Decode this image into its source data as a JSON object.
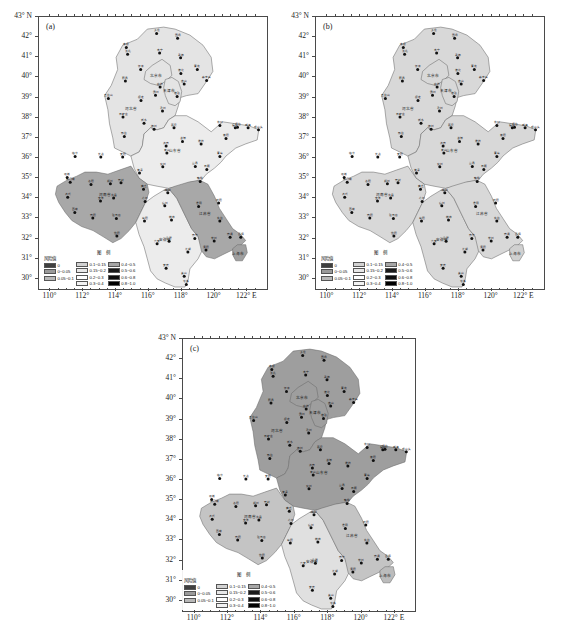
{
  "figure": {
    "type": "multi-panel-choropleth-map",
    "panel_count": 3
  },
  "panels": [
    {
      "id": "a",
      "label": "(a)"
    },
    {
      "id": "b",
      "label": "(b)"
    },
    {
      "id": "c",
      "label": "(c)"
    }
  ],
  "axes": {
    "ylabel_suffix": "N",
    "xlabel_suffix": "E",
    "yticks": [
      "43",
      "42",
      "41",
      "40",
      "39",
      "38",
      "37",
      "36",
      "35",
      "34",
      "33",
      "32",
      "31",
      "30"
    ],
    "ytick_values": [
      43,
      42,
      41,
      40,
      39,
      38,
      37,
      36,
      35,
      34,
      33,
      32,
      31,
      30
    ],
    "xticks": [
      "110",
      "112",
      "114",
      "116",
      "118",
      "120",
      "122"
    ],
    "xtick_values": [
      110,
      112,
      114,
      116,
      118,
      120,
      122
    ],
    "ylim": [
      29.5,
      43
    ],
    "xlim": [
      109.3,
      123.2
    ],
    "first_ytick_label": "43° N",
    "last_xtick_label": "122° E",
    "degree_symbol": "°"
  },
  "legend": {
    "title": "图 例",
    "risk_header": "风险值",
    "columns": [
      {
        "entries": [
          {
            "label": "0",
            "color": "#3f3f3f"
          },
          {
            "label": "0~0.05",
            "color": "#9a9a9a"
          },
          {
            "label": "0.05~0.1",
            "color": "#b8b8b8"
          }
        ]
      },
      {
        "entries": [
          {
            "label": "0.1~0.15",
            "color": "#d2d2d2"
          },
          {
            "label": "0.15~0.2",
            "color": "#e8e8e8"
          },
          {
            "label": "0.2~0.3",
            "color": "#ffffff"
          },
          {
            "label": "0.3~0.4",
            "color": "#f2f2f2"
          }
        ]
      },
      {
        "entries": [
          {
            "label": "0.4~0.5",
            "color": "#a6a6a6"
          },
          {
            "label": "0.5~0.6",
            "color": "#1a1a1a"
          },
          {
            "label": "0.6~0.8",
            "color": "#0d0d0d"
          },
          {
            "label": "0.8~1.0",
            "color": "#000000"
          }
        ]
      }
    ]
  },
  "chart_data": {
    "type": "heatmap",
    "title": "",
    "xlabel": "Longitude (°E)",
    "ylabel": "Latitude (°N)",
    "xlim": [
      109.3,
      123.2
    ],
    "ylim": [
      29.5,
      43
    ],
    "grid": false,
    "legend_position": "inside-bottom-left",
    "categories": [
      "河北省",
      "北京市",
      "天津市",
      "山东省",
      "河南省",
      "安徽省",
      "江苏省",
      "上海市"
    ],
    "series": [
      {
        "name": "(a)",
        "values": [
          0.17,
          0.17,
          0.17,
          0.25,
          0.45,
          0.25,
          0.45,
          0.45
        ]
      },
      {
        "name": "(b)",
        "values": [
          0.13,
          0.13,
          0.13,
          0.13,
          0.13,
          0.13,
          0.13,
          0.13
        ]
      },
      {
        "name": "(c)",
        "values": [
          0.45,
          0.45,
          0.45,
          0.45,
          0.25,
          0.17,
          0.25,
          0.25
        ]
      }
    ]
  },
  "regions": [
    {
      "name": "北京市",
      "lon": 116.4,
      "lat": 40.0
    },
    {
      "name": "天津市",
      "lon": 117.2,
      "lat": 39.3
    },
    {
      "name": "河北省",
      "lon": 114.9,
      "lat": 38.4
    },
    {
      "name": "山东省",
      "lon": 117.6,
      "lat": 36.3
    },
    {
      "name": "河南省",
      "lon": 113.3,
      "lat": 34.1
    },
    {
      "name": "安徽省",
      "lon": 117.0,
      "lat": 31.9
    },
    {
      "name": "江苏省",
      "lon": 119.4,
      "lat": 33.2
    },
    {
      "name": "上海市",
      "lon": 121.4,
      "lat": 31.2
    }
  ],
  "stations": [
    {
      "name": "围场",
      "lon": 117.75,
      "lat": 41.95
    },
    {
      "name": "多伦",
      "lon": 116.47,
      "lat": 42.18
    },
    {
      "name": "张北",
      "lon": 114.7,
      "lat": 41.15
    },
    {
      "name": "康保",
      "lon": 114.62,
      "lat": 41.48
    },
    {
      "name": "丰宁",
      "lon": 116.65,
      "lat": 41.22
    },
    {
      "name": "承德",
      "lon": 117.93,
      "lat": 40.98
    },
    {
      "name": "青龙",
      "lon": 118.95,
      "lat": 40.4
    },
    {
      "name": "怀来",
      "lon": 115.5,
      "lat": 40.4
    },
    {
      "name": "蔚县",
      "lon": 114.57,
      "lat": 39.83
    },
    {
      "name": "遵化",
      "lon": 117.95,
      "lat": 40.2
    },
    {
      "name": "秦皇岛",
      "lon": 119.52,
      "lat": 39.85
    },
    {
      "name": "唐山",
      "lon": 118.15,
      "lat": 39.67
    },
    {
      "name": "廊坊",
      "lon": 116.68,
      "lat": 39.52
    },
    {
      "name": "塘沽",
      "lon": 117.72,
      "lat": 39.05
    },
    {
      "name": "霸州",
      "lon": 116.4,
      "lat": 39.12
    },
    {
      "name": "保定",
      "lon": 115.52,
      "lat": 38.85
    },
    {
      "name": "沧州",
      "lon": 116.83,
      "lat": 38.33
    },
    {
      "name": "五台山",
      "lon": 113.53,
      "lat": 38.95
    },
    {
      "name": "石家庄",
      "lon": 114.42,
      "lat": 38.03
    },
    {
      "name": "衡水",
      "lon": 115.7,
      "lat": 37.73
    },
    {
      "name": "邢台",
      "lon": 114.5,
      "lat": 37.07
    },
    {
      "name": "德州",
      "lon": 116.32,
      "lat": 37.43
    },
    {
      "name": "惠民",
      "lon": 117.53,
      "lat": 37.5
    },
    {
      "name": "龙口",
      "lon": 120.33,
      "lat": 37.62
    },
    {
      "name": "烟台",
      "lon": 121.4,
      "lat": 37.53
    },
    {
      "name": "威海",
      "lon": 122.05,
      "lat": 37.5
    },
    {
      "name": "成山头",
      "lon": 122.68,
      "lat": 37.4
    },
    {
      "name": "福山",
      "lon": 121.27,
      "lat": 37.5
    },
    {
      "name": "济南",
      "lon": 117.05,
      "lat": 36.6
    },
    {
      "name": "潍坊",
      "lon": 119.18,
      "lat": 36.7
    },
    {
      "name": "青岛",
      "lon": 120.33,
      "lat": 36.07
    },
    {
      "name": "莱阳",
      "lon": 120.7,
      "lat": 36.97
    },
    {
      "name": "淄博",
      "lon": 118.05,
      "lat": 36.82
    },
    {
      "name": "泰山",
      "lon": 117.1,
      "lat": 36.25
    },
    {
      "name": "兖州",
      "lon": 116.85,
      "lat": 35.57
    },
    {
      "name": "莒县",
      "lon": 118.83,
      "lat": 35.58
    },
    {
      "name": "日照",
      "lon": 119.53,
      "lat": 35.43
    },
    {
      "name": "菏泽",
      "lon": 115.43,
      "lat": 35.25
    },
    {
      "name": "安阳",
      "lon": 114.4,
      "lat": 36.05
    },
    {
      "name": "长治",
      "lon": 113.07,
      "lat": 36.05
    },
    {
      "name": "临汾",
      "lon": 111.5,
      "lat": 36.07
    },
    {
      "name": "运城",
      "lon": 111.02,
      "lat": 35.03
    },
    {
      "name": "三门峡",
      "lon": 111.2,
      "lat": 34.8
    },
    {
      "name": "洛阳",
      "lon": 112.47,
      "lat": 34.68
    },
    {
      "name": "郑州",
      "lon": 113.65,
      "lat": 34.72
    },
    {
      "name": "开封",
      "lon": 114.3,
      "lat": 34.77
    },
    {
      "name": "商丘",
      "lon": 115.67,
      "lat": 34.45
    },
    {
      "name": "许昌",
      "lon": 113.85,
      "lat": 34.02
    },
    {
      "name": "南阳",
      "lon": 112.58,
      "lat": 33.03
    },
    {
      "name": "信阳",
      "lon": 114.05,
      "lat": 32.13
    },
    {
      "name": "驻马店",
      "lon": 114.02,
      "lat": 33.0
    },
    {
      "name": "西峡",
      "lon": 111.48,
      "lat": 33.3
    },
    {
      "name": "卢氏",
      "lon": 111.05,
      "lat": 34.05
    },
    {
      "name": "宝丰",
      "lon": 113.05,
      "lat": 33.87
    },
    {
      "name": "亳州",
      "lon": 115.77,
      "lat": 33.85
    },
    {
      "name": "阜阳",
      "lon": 115.73,
      "lat": 32.87
    },
    {
      "name": "宿州",
      "lon": 116.97,
      "lat": 33.63
    },
    {
      "name": "蚌埠",
      "lon": 117.38,
      "lat": 32.92
    },
    {
      "name": "合肥",
      "lon": 117.23,
      "lat": 31.87
    },
    {
      "name": "六安",
      "lon": 116.5,
      "lat": 31.75
    },
    {
      "name": "安庆",
      "lon": 117.05,
      "lat": 30.53
    },
    {
      "name": "黄山",
      "lon": 118.15,
      "lat": 30.13
    },
    {
      "name": "屯溪",
      "lon": 118.28,
      "lat": 29.72
    },
    {
      "name": "芜湖",
      "lon": 118.38,
      "lat": 31.33
    },
    {
      "name": "徐州",
      "lon": 117.15,
      "lat": 34.28
    },
    {
      "name": "赣榆",
      "lon": 119.13,
      "lat": 34.83
    },
    {
      "name": "淮阴",
      "lon": 119.03,
      "lat": 33.6
    },
    {
      "name": "射阳",
      "lon": 120.25,
      "lat": 33.77
    },
    {
      "name": "南通",
      "lon": 120.95,
      "lat": 32.07
    },
    {
      "name": "南京",
      "lon": 118.8,
      "lat": 32.0
    },
    {
      "name": "常州",
      "lon": 119.98,
      "lat": 31.88
    },
    {
      "name": "吕泗",
      "lon": 121.6,
      "lat": 32.07
    },
    {
      "name": "东台",
      "lon": 120.32,
      "lat": 32.87
    },
    {
      "name": "溧阳",
      "lon": 119.48,
      "lat": 31.43
    }
  ]
}
